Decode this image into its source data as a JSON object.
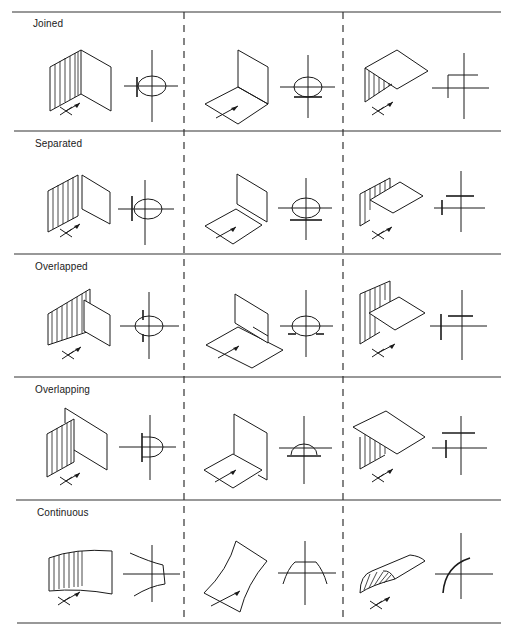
{
  "diagram": {
    "columns": 3,
    "rows": [
      {
        "label": "Joined"
      },
      {
        "label": "Separated"
      },
      {
        "label": "Overlapped"
      },
      {
        "label": "Overlapping"
      },
      {
        "label": "Continuous"
      }
    ],
    "line_color": "#1a1a1a",
    "background": "#ffffff"
  }
}
